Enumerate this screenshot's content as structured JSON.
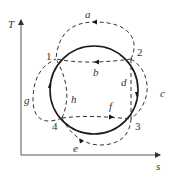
{
  "diagram": {
    "type": "T-s diagram with reversible cycle and alternative paths",
    "axes": {
      "y_label": "T",
      "x_label": "s"
    },
    "points": [
      {
        "id": "1",
        "label": "1"
      },
      {
        "id": "2",
        "label": "2"
      },
      {
        "id": "3",
        "label": "3"
      },
      {
        "id": "4",
        "label": "4"
      }
    ],
    "paths": [
      {
        "id": "a",
        "label": "a",
        "from": "2",
        "to": "1",
        "style": "dashed",
        "direction": "leftward over top"
      },
      {
        "id": "b",
        "label": "b",
        "from": "2",
        "to": "1",
        "style": "dashed",
        "direction": "leftward horizontal"
      },
      {
        "id": "c",
        "label": "c",
        "from": "2",
        "to": "3",
        "style": "dashed",
        "direction": "outer right arc"
      },
      {
        "id": "d",
        "label": "d",
        "from": "2",
        "to": "3",
        "style": "dashed",
        "direction": "vertical"
      },
      {
        "id": "e",
        "label": "e",
        "from": "4",
        "to": "3",
        "style": "dashed",
        "direction": "lower arc rightward"
      },
      {
        "id": "f",
        "label": "f",
        "from": "4",
        "to": "3",
        "style": "dashed",
        "direction": "horizontal rightward"
      },
      {
        "id": "g",
        "label": "g",
        "from": "4",
        "to": "1",
        "style": "dashed",
        "direction": "outer left arc"
      },
      {
        "id": "h",
        "label": "h",
        "from": "4",
        "to": "1",
        "style": "dashed",
        "direction": "inner"
      }
    ],
    "main_cycle": {
      "style": "solid",
      "direction": "clockwise",
      "sequence": [
        "1",
        "2",
        "3",
        "4"
      ]
    }
  }
}
